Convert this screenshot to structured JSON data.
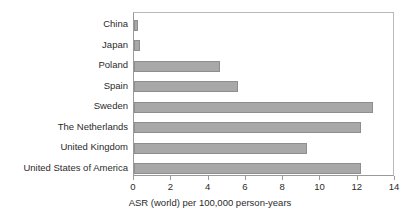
{
  "chart_data": {
    "type": "bar",
    "orientation": "horizontal",
    "title": "",
    "xlabel": "ASR (world) per 100,000 person-years",
    "ylabel": "",
    "categories": [
      "China",
      "Japan",
      "Poland",
      "Spain",
      "Sweden",
      "The Netherlands",
      "United Kingdom",
      "United States of America"
    ],
    "values": [
      0.2,
      0.3,
      4.6,
      5.6,
      12.8,
      12.2,
      9.3,
      12.2
    ],
    "xlim": [
      0,
      14
    ],
    "xticks": [
      0,
      2,
      4,
      6,
      8,
      10,
      12,
      14
    ],
    "xtick_labels": [
      "0",
      "2",
      "4",
      "6",
      "8",
      "10",
      "12",
      "14"
    ],
    "grid": false,
    "legend": null,
    "bar_color": "#a8a8a8",
    "bar_border_color": "#8e8e8e",
    "axis_color": "#9a9a9a",
    "text_color": "#2b2b2b"
  }
}
